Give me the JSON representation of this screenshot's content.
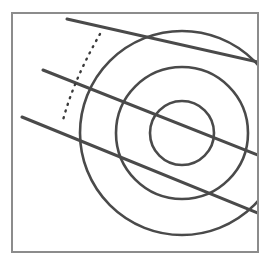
{
  "figure": {
    "title": "Concentric circles intersected by three parallel diagonal lines",
    "canvas": {
      "width": 269,
      "height": 261,
      "background": "#ffffff"
    },
    "frame": {
      "label": "Figure border",
      "x": 12,
      "y": 13,
      "width": 246,
      "height": 239,
      "stroke": "#8c8c8c",
      "stroke_width": 2,
      "fill": "none"
    },
    "circles": {
      "label": "Concentric circles",
      "center": {
        "x": 182,
        "y": 133
      },
      "stroke": "#4a4a4a",
      "stroke_width": 2.6,
      "fill": "none",
      "items": [
        {
          "name": "outer-circle",
          "radius": 102
        },
        {
          "name": "middle-circle",
          "radius": 66
        },
        {
          "name": "inner-circle",
          "radius": 32
        }
      ]
    },
    "lines": {
      "label": "Parallel diagonal lines",
      "stroke": "#4a4a4a",
      "stroke_width": 3.0,
      "slope_note": "three parallel chords descending left to right",
      "items": [
        {
          "name": "diagonal-line-1",
          "x1": 67,
          "y1": 19,
          "x2": 258,
          "y2": 62
        },
        {
          "name": "diagonal-line-2",
          "x1": 43,
          "y1": 70,
          "x2": 258,
          "y2": 155
        },
        {
          "name": "diagonal-line-3",
          "x1": 22,
          "y1": 117,
          "x2": 258,
          "y2": 213
        }
      ]
    },
    "dotted_curve": {
      "name": "dotted-arc",
      "label": "Dotted arc marker",
      "stroke": "#3a3a3a",
      "stroke_width": 2.4,
      "dash": "1 6",
      "path": "M 100 34 C 84 62, 70 92, 62 124"
    }
  }
}
